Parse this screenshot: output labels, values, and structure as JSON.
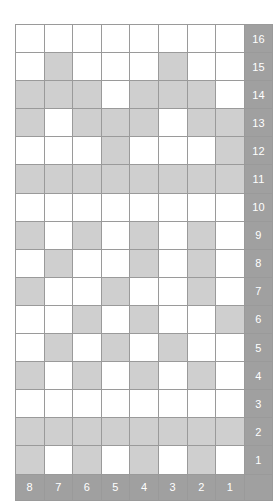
{
  "chart_data": {
    "type": "heatmap",
    "title": "",
    "xlabel": "",
    "ylabel": "",
    "legend": [],
    "grid": true,
    "colors": {
      "filled": "#cfcfcf",
      "empty": "#ffffff",
      "label_background": "#a0a0a0",
      "label_text": "#ffffff",
      "gridline": "#9a9a9a"
    },
    "columns": 8,
    "rows": 16,
    "column_labels": [
      "8",
      "7",
      "6",
      "5",
      "4",
      "3",
      "2",
      "1"
    ],
    "row_labels": [
      "16",
      "15",
      "14",
      "13",
      "12",
      "11",
      "10",
      "9",
      "8",
      "7",
      "6",
      "5",
      "4",
      "3",
      "2",
      "1"
    ],
    "corner_label": "",
    "cells": [
      {
        "row_label": "16",
        "values": [
          0,
          0,
          0,
          0,
          0,
          0,
          0,
          0
        ]
      },
      {
        "row_label": "15",
        "values": [
          0,
          1,
          0,
          0,
          0,
          1,
          0,
          0
        ]
      },
      {
        "row_label": "14",
        "values": [
          1,
          1,
          1,
          0,
          1,
          1,
          1,
          0
        ]
      },
      {
        "row_label": "13",
        "values": [
          1,
          0,
          1,
          1,
          1,
          0,
          1,
          1
        ]
      },
      {
        "row_label": "12",
        "values": [
          0,
          0,
          0,
          1,
          0,
          0,
          0,
          1
        ]
      },
      {
        "row_label": "11",
        "values": [
          1,
          1,
          1,
          1,
          1,
          1,
          1,
          1
        ]
      },
      {
        "row_label": "10",
        "values": [
          0,
          0,
          0,
          0,
          0,
          0,
          0,
          0
        ]
      },
      {
        "row_label": "9",
        "values": [
          1,
          0,
          1,
          0,
          1,
          0,
          1,
          0
        ]
      },
      {
        "row_label": "8",
        "values": [
          0,
          1,
          0,
          0,
          1,
          0,
          1,
          0
        ]
      },
      {
        "row_label": "7",
        "values": [
          1,
          0,
          0,
          1,
          0,
          0,
          1,
          0
        ]
      },
      {
        "row_label": "6",
        "values": [
          0,
          0,
          1,
          0,
          1,
          0,
          0,
          1
        ]
      },
      {
        "row_label": "5",
        "values": [
          0,
          1,
          0,
          1,
          0,
          1,
          0,
          0
        ]
      },
      {
        "row_label": "4",
        "values": [
          1,
          0,
          1,
          0,
          1,
          0,
          1,
          0
        ]
      },
      {
        "row_label": "3",
        "values": [
          0,
          0,
          0,
          0,
          0,
          0,
          0,
          0
        ]
      },
      {
        "row_label": "2",
        "values": [
          1,
          1,
          1,
          1,
          1,
          1,
          1,
          1
        ]
      },
      {
        "row_label": "1",
        "values": [
          1,
          0,
          1,
          0,
          1,
          0,
          1,
          0
        ]
      }
    ]
  }
}
